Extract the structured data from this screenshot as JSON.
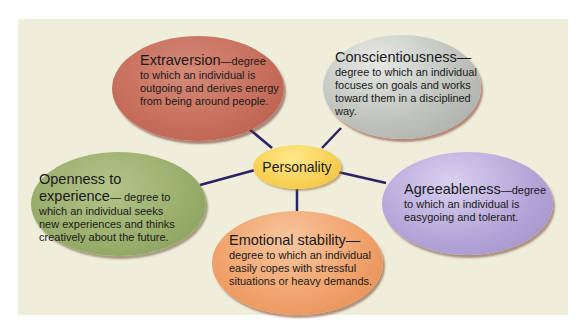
{
  "diagram": {
    "center": {
      "label": "Personality",
      "color": "#f7d054"
    },
    "traits": [
      {
        "id": "extraversion",
        "title": "Extraversion",
        "title_suffix": "—degree",
        "lines": [
          "to which an individual is",
          "outgoing and derives energy",
          "from being around people."
        ],
        "color": "#c56d5a"
      },
      {
        "id": "conscientiousness",
        "title": "Conscientiousness—",
        "lines": [
          "degree to which an individual",
          "focuses on goals and works",
          "toward them in a disciplined",
          "way."
        ],
        "color": "#bfc3bc"
      },
      {
        "id": "openness",
        "title": "Openness to",
        "title2": "experience",
        "title2_suffix": "— degree to",
        "lines": [
          "which an individual seeks",
          "new experiences and thinks",
          "creatively about the future."
        ],
        "color": "#98ad6a"
      },
      {
        "id": "agreeableness",
        "title": "Agreeableness",
        "title_suffix": "—degree",
        "lines": [
          "to which an individual is",
          "easygoing and tolerant."
        ],
        "color": "#b4a6d8"
      },
      {
        "id": "emotional-stability",
        "title": "Emotional stability—",
        "lines": [
          "degree to which an individual",
          "easily copes with stressful",
          "situations or heavy demands."
        ],
        "color": "#f0a26c"
      }
    ],
    "connector_color": "#2e2266",
    "background_color": "#eeeedb"
  }
}
